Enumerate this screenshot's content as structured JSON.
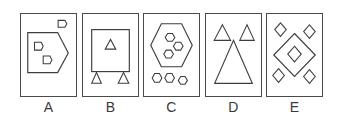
{
  "figure": {
    "kind": "shape-comparison-panels",
    "panel_count": 5,
    "stroke_color": "#3d3d3d",
    "border_color": "#4a4a4a",
    "background_color": "#ffffff",
    "label_color": "#3a3a3a"
  },
  "panels": [
    {
      "id": "A",
      "label": "A",
      "shape_family": "pentagon-d",
      "large_shape": "pentagon",
      "large_shape_count": 1,
      "small_shape": "pentagon-d",
      "small_shapes_inside": 2,
      "small_shapes_outside": 1,
      "small_shape_total": 3
    },
    {
      "id": "B",
      "label": "B",
      "shape_family": "square-triangle",
      "large_shape": "square",
      "large_shape_count": 1,
      "small_shape": "triangle",
      "small_shapes_inside": 1,
      "small_shapes_outside": 2,
      "small_shape_total": 3
    },
    {
      "id": "C",
      "label": "C",
      "shape_family": "hexagon",
      "large_shape": "hexagon",
      "large_shape_count": 1,
      "small_shape": "hexagon",
      "small_shapes_inside": 3,
      "small_shapes_outside": 3,
      "small_shape_total": 6
    },
    {
      "id": "D",
      "label": "D",
      "shape_family": "triangle",
      "large_shape": "triangle",
      "large_shape_count": 1,
      "small_shape": "triangle",
      "small_shapes_inside": 0,
      "small_shapes_outside": 2,
      "small_shape_total": 2
    },
    {
      "id": "E",
      "label": "E",
      "shape_family": "diamond",
      "large_shape": "diamond",
      "large_shape_count": 1,
      "small_shape": "diamond",
      "small_shapes_inside": 1,
      "small_shapes_outside": 4,
      "small_shape_total": 5
    }
  ]
}
